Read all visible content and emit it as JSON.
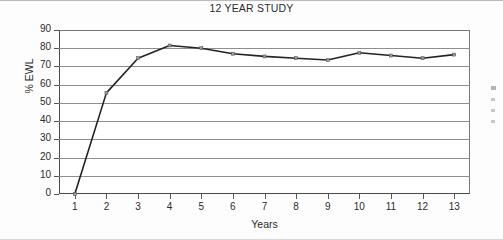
{
  "chart_data": {
    "type": "line",
    "title": "12 YEAR STUDY",
    "xlabel": "Years",
    "ylabel": "% EWL",
    "x": [
      1,
      2,
      3,
      4,
      5,
      6,
      7,
      8,
      9,
      10,
      11,
      12,
      13
    ],
    "categories": [
      "1",
      "2",
      "3",
      "4",
      "5",
      "6",
      "7",
      "8",
      "9",
      "10",
      "11",
      "12",
      "13"
    ],
    "values": [
      0,
      55.5,
      74.5,
      81.5,
      80,
      77,
      75.5,
      74.5,
      73.5,
      77.5,
      76,
      74.5,
      76.5
    ],
    "series": [
      {
        "name": "% EWL",
        "values": [
          0,
          55.5,
          74.5,
          81.5,
          80,
          77,
          75.5,
          74.5,
          73.5,
          77.5,
          76,
          74.5,
          76.5
        ]
      }
    ],
    "ylim": [
      0,
      90
    ],
    "xlim": [
      0.5,
      13.5
    ],
    "ytick_labels": [
      "90",
      "80",
      "70",
      "60",
      "50",
      "40",
      "30",
      "20",
      "10",
      "0"
    ],
    "yticks": [
      90,
      80,
      70,
      60,
      50,
      40,
      30,
      20,
      10,
      0
    ],
    "xtick_labels": [
      "1",
      "2",
      "3",
      "4",
      "5",
      "6",
      "7",
      "8",
      "9",
      "10",
      "11",
      "12",
      "13"
    ],
    "grid": "horizontal",
    "legend": "cropped-right",
    "line_color": "#232323",
    "grid_color": "#8e8e8e",
    "marker": "small-square"
  }
}
